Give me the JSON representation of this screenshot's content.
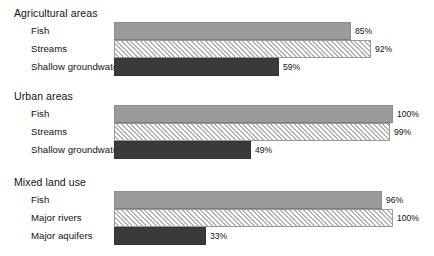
{
  "chart_data": {
    "type": "bar",
    "orientation": "horizontal",
    "title": "",
    "xlabel": "",
    "ylabel": "",
    "xlim": [
      0,
      100
    ],
    "grid": false,
    "legend": false,
    "value_suffix": "%",
    "groups": [
      {
        "name": "Agricultural areas",
        "categories": [
          "Fish",
          "Streams",
          "Shallow groundwater"
        ],
        "values": [
          85,
          92,
          59
        ],
        "value_labels": [
          "85%",
          "92%",
          "59%"
        ],
        "styles": [
          "solid-mid",
          "hatched",
          "solid-dark"
        ]
      },
      {
        "name": "Urban areas",
        "categories": [
          "Fish",
          "Streams",
          "Shallow groundwater"
        ],
        "values": [
          100,
          99,
          49
        ],
        "value_labels": [
          "100%",
          "99%",
          "49%"
        ],
        "styles": [
          "solid-mid",
          "hatched",
          "solid-dark"
        ]
      },
      {
        "name": "Mixed land use",
        "categories": [
          "Fish",
          "Major rivers",
          "Major aquifers"
        ],
        "values": [
          96,
          100,
          33
        ],
        "value_labels": [
          "96%",
          "100%",
          "33%"
        ],
        "styles": [
          "solid-mid",
          "hatched",
          "solid-dark"
        ]
      }
    ],
    "colors": {
      "solid_mid": "#9b9b9b",
      "hatched_line": "#b4b4b4",
      "hatched_fill": "#fdfdfd",
      "solid_dark": "#3a3a3a",
      "text": "#111111",
      "background": "#ffffff"
    }
  }
}
